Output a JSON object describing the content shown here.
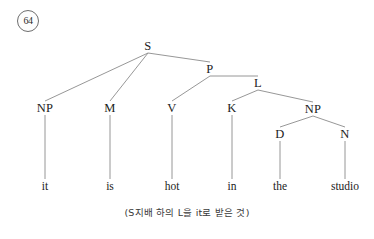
{
  "figure": {
    "number": "64",
    "caption": "(S지배 하의 L을 it로 받은 것)"
  },
  "tree": {
    "nodes": [
      {
        "id": "S",
        "label": "S",
        "x": 148,
        "y": 46
      },
      {
        "id": "NP1",
        "label": "NP",
        "x": 45,
        "y": 108
      },
      {
        "id": "M",
        "label": "M",
        "x": 110,
        "y": 108
      },
      {
        "id": "P",
        "label": "P",
        "x": 210,
        "y": 69
      },
      {
        "id": "V",
        "label": "V",
        "x": 172,
        "y": 108
      },
      {
        "id": "L",
        "label": "L",
        "x": 258,
        "y": 83
      },
      {
        "id": "K",
        "label": "K",
        "x": 232,
        "y": 108
      },
      {
        "id": "NP2",
        "label": "NP",
        "x": 313,
        "y": 109
      },
      {
        "id": "D",
        "label": "D",
        "x": 280,
        "y": 134
      },
      {
        "id": "N",
        "label": "N",
        "x": 345,
        "y": 134
      }
    ],
    "edges": [
      {
        "from": "S",
        "to": "NP1"
      },
      {
        "from": "S",
        "to": "M"
      },
      {
        "from": "S",
        "to": "P"
      },
      {
        "from": "P",
        "to": "V"
      },
      {
        "from": "P",
        "to": "L"
      },
      {
        "from": "L",
        "to": "K"
      },
      {
        "from": "L",
        "to": "NP2"
      },
      {
        "from": "NP2",
        "to": "D"
      },
      {
        "from": "NP2",
        "to": "N"
      }
    ],
    "leaves": [
      {
        "id": "leaf-it",
        "label": "it",
        "parent": "NP1",
        "x": 45,
        "y": 186
      },
      {
        "id": "leaf-is",
        "label": "is",
        "parent": "M",
        "x": 110,
        "y": 186
      },
      {
        "id": "leaf-hot",
        "label": "hot",
        "parent": "V",
        "x": 172,
        "y": 186
      },
      {
        "id": "leaf-in",
        "label": "in",
        "parent": "K",
        "x": 232,
        "y": 186
      },
      {
        "id": "leaf-the",
        "label": "the",
        "parent": "D",
        "x": 280,
        "y": 186
      },
      {
        "id": "leaf-studio",
        "label": "studio",
        "parent": "N",
        "x": 345,
        "y": 186
      }
    ]
  },
  "colors": {
    "background": "#ffffff",
    "line": "#8b8b8b",
    "text": "#1c1c1c",
    "caption": "#3a3a3a"
  }
}
